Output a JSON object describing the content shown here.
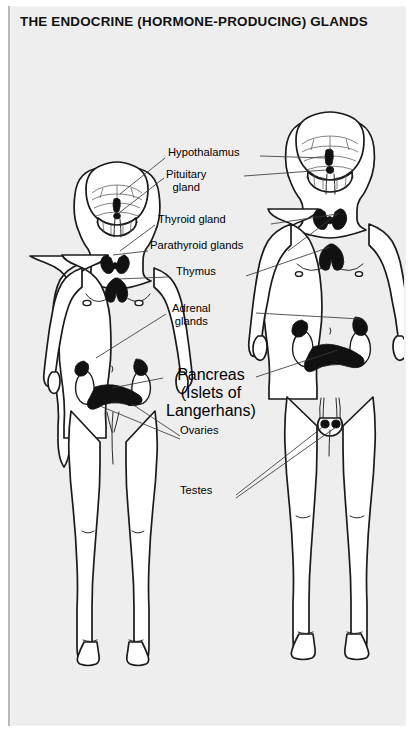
{
  "page": {
    "title": "THE ENDOCRINE (HORMONE-PRODUCING) GLANDS",
    "panel_bg": "#eeeeee",
    "ink": "#000000",
    "figure_fill": "#ffffff"
  },
  "figures": [
    {
      "name": "female-figure",
      "side": "left",
      "sex": "female"
    },
    {
      "name": "male-figure",
      "side": "right",
      "sex": "male"
    }
  ],
  "labels": [
    {
      "id": "hypothalamus",
      "text": "Hypothalamus",
      "sub": "",
      "x": 208,
      "y": 152
    },
    {
      "id": "pituitary-gland",
      "text": "Pituitary",
      "sub": "gland",
      "x": 201,
      "y": 174
    },
    {
      "id": "thyroid-gland",
      "text": "Thyroid gland",
      "sub": "",
      "x": 205,
      "y": 219
    },
    {
      "id": "parathyroid-glands",
      "text": "Parathyroid glands",
      "sub": "",
      "x": 209,
      "y": 245
    },
    {
      "id": "thymus",
      "text": "Thymus",
      "sub": "",
      "x": 206,
      "y": 271
    },
    {
      "id": "adrenal-glands",
      "text": "Adrenal",
      "sub": "glands",
      "x": 204,
      "y": 310
    },
    {
      "id": "pancreas",
      "text": "Pancreas",
      "sub": "(Islets of|Langerhans)",
      "x": 202,
      "y": 372
    },
    {
      "id": "ovaries",
      "text": "Ovaries",
      "sub": "",
      "x": 204,
      "y": 430
    },
    {
      "id": "testes",
      "text": "Testes",
      "sub": "",
      "x": 201,
      "y": 490
    }
  ],
  "glands": [
    {
      "id": "brain-hypothalamus",
      "label": "hypothalamus"
    },
    {
      "id": "brain-pituitary",
      "label": "pituitary-gland"
    },
    {
      "id": "neck-thyroid",
      "label": "thyroid-gland"
    },
    {
      "id": "neck-parathyroid",
      "label": "parathyroid-glands"
    },
    {
      "id": "chest-thymus",
      "label": "thymus"
    },
    {
      "id": "kidney-adrenal",
      "label": "adrenal-glands"
    },
    {
      "id": "abdomen-pancreas",
      "label": "pancreas"
    },
    {
      "id": "pelvis-ovaries",
      "label": "ovaries"
    },
    {
      "id": "pelvis-testes",
      "label": "testes"
    }
  ]
}
